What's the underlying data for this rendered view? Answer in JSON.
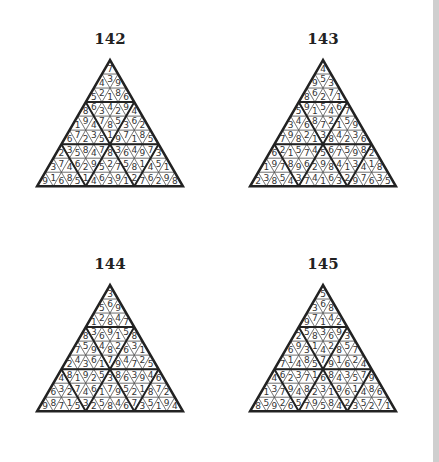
{
  "puzzles": [
    {
      "title": "142",
      "rows": [
        {
          "digits": "7",
          "shade": "d"
        },
        {
          "digits": "439",
          "shade": "dwd"
        },
        {
          "digits": "52186",
          "shade": "dwwwd"
        },
        {
          "digits": "8634294",
          "shade": "dwwwwwd"
        },
        {
          "digits": "194785362",
          "shade": "dmmmmmmmd"
        },
        {
          "digits": "67235197185",
          "shade": "dmmwwwwwmmd"
        },
        {
          "digits": "2358478364973",
          "shade": "dwwmmwmmmwwwd"
        },
        {
          "digits": "374629527581451",
          "shade": "dwwwwmwmmwwwwwd"
        },
        {
          "digits": "91685146391276298",
          "shade": "dwdwdwdmdmwmdwdwd"
        }
      ]
    },
    {
      "title": "143",
      "rows": [
        {
          "digits": "4",
          "shade": "w"
        },
        {
          "digits": "953",
          "shade": "www"
        },
        {
          "digits": "86271",
          "shade": "wwwww"
        },
        {
          "digits": "5915467",
          "shade": "wwwwwww"
        },
        {
          "digits": "346872159",
          "shade": "ddddddddd"
        },
        {
          "digits": "79821384236",
          "shade": "wddwwwwwddw"
        },
        {
          "digits": "6215745675982",
          "shade": "wwwddwwwddwww"
        },
        {
          "digits": "197896298413418",
          "shade": "wwwwddwddwwwwww"
        },
        {
          "digits": "23854374163297635",
          "shade": "wwwwwwwdddwwwwwww"
        }
      ]
    },
    {
      "title": "144",
      "rows": [
        {
          "digits": "3",
          "shade": "l"
        },
        {
          "digits": "569",
          "shade": "lwl"
        },
        {
          "digits": "12847",
          "shade": "lwwwl"
        },
        {
          "digits": "8369158",
          "shade": "lwwwwwl"
        },
        {
          "digits": "759482631",
          "shade": "mlllllllm"
        },
        {
          "digits": "24361794725",
          "shade": "llllwwwllll"
        },
        {
          "digits": "4819253863946",
          "shade": "lwwwllwllwwwl"
        },
        {
          "digits": "632746179521872",
          "shade": "llllwlllllwwwll"
        },
        {
          "digits": "98715325846735194",
          "shade": "lllwlllmllwlwlwll"
        }
      ]
    },
    {
      "title": "145",
      "rows": [
        {
          "digits": "5",
          "shade": "l"
        },
        {
          "digits": "368",
          "shade": "lwl"
        },
        {
          "digits": "97142",
          "shade": "lwwwl"
        },
        {
          "digits": "2583693",
          "shade": "lwwwwwl"
        },
        {
          "digits": "693142857",
          "shade": "mllllllm"
        },
        {
          "digits": "71485791624",
          "shade": "llllwwwllll"
        },
        {
          "digits": "4623716843579",
          "shade": "lwwllwllwwwwl"
        },
        {
          "digits": "137948231961486",
          "shade": "lwlllllllwwlwll"
        },
        {
          "digits": "85926579584235271",
          "shade": "lwlwlwlmllwlwlwll"
        }
      ]
    }
  ]
}
